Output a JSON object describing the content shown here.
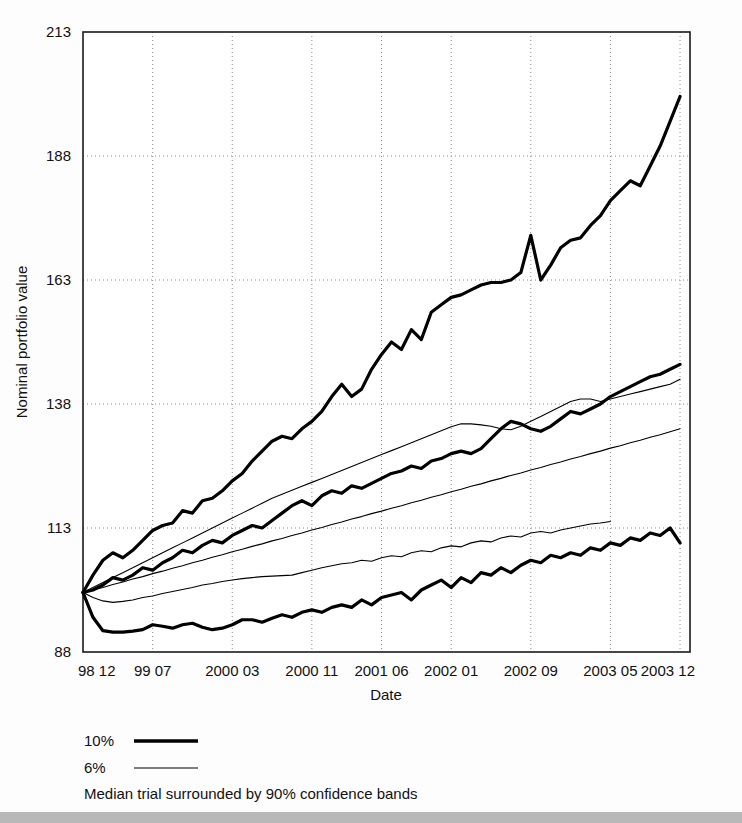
{
  "chart_data": {
    "type": "line",
    "title": "",
    "xlabel": "Date",
    "ylabel": "Nominal portfolio value",
    "grid": true,
    "legend_position": "below-axes-left",
    "caption": "Median trial surrounded by 90% confidence bands",
    "ylim": [
      88,
      213
    ],
    "yticks": [
      88,
      113,
      138,
      163,
      188,
      213
    ],
    "ytick_labels": [
      "88",
      "113",
      "138",
      "163",
      "188",
      "213"
    ],
    "xlim": [
      0,
      61
    ],
    "xticks": [
      0,
      7,
      15,
      23,
      30,
      37,
      45,
      53,
      60
    ],
    "xtick_labels": [
      "98 12",
      "99 07",
      "2000 03",
      "2000 11",
      "2001 06",
      "2002 01",
      "2002 09",
      "2003 05",
      "2003 12"
    ],
    "legend": [
      {
        "label": "10%",
        "style": "thick"
      },
      {
        "label": "6%",
        "style": "thin"
      }
    ],
    "series": [
      {
        "name": "10% upper 95th percentile band",
        "style": "thick",
        "linewidth": 3.2,
        "color": "#000000",
        "x": [
          0,
          1,
          2,
          3,
          4,
          5,
          6,
          7,
          8,
          9,
          10,
          11,
          12,
          13,
          14,
          15,
          16,
          17,
          18,
          19,
          20,
          21,
          22,
          23,
          24,
          25,
          26,
          27,
          28,
          29,
          30,
          31,
          32,
          33,
          34,
          35,
          36,
          37,
          38,
          39,
          40,
          41,
          42,
          43,
          44,
          45,
          46,
          47,
          48,
          49,
          50,
          51,
          52,
          53,
          54,
          55,
          56,
          57,
          58,
          59,
          60
        ],
        "values": [
          100,
          103.5,
          106.5,
          108.0,
          107.0,
          108.5,
          110.5,
          112.5,
          113.5,
          114.0,
          116.5,
          116.0,
          118.5,
          119.0,
          120.5,
          122.5,
          124.0,
          126.5,
          128.5,
          130.5,
          131.5,
          131.0,
          133.0,
          134.5,
          136.5,
          139.5,
          142.0,
          139.5,
          141.0,
          145.0,
          148.0,
          150.5,
          149.0,
          153.0,
          151.0,
          156.5,
          158.0,
          159.5,
          160.0,
          161.0,
          162.0,
          162.5,
          162.5,
          163.0,
          164.5,
          172.0,
          163.0,
          166.0,
          169.5,
          171.0,
          171.5,
          174.0,
          176.0,
          179.0,
          181.0,
          183.0,
          182.0,
          186.0,
          190.0,
          195.0,
          200.0
        ]
      },
      {
        "name": "10% median trial",
        "style": "thick",
        "linewidth": 3.2,
        "color": "#000000",
        "x": [
          0,
          1,
          2,
          3,
          4,
          5,
          6,
          7,
          8,
          9,
          10,
          11,
          12,
          13,
          14,
          15,
          16,
          17,
          18,
          19,
          20,
          21,
          22,
          23,
          24,
          25,
          26,
          27,
          28,
          29,
          30,
          31,
          32,
          33,
          34,
          35,
          36,
          37,
          38,
          39,
          40,
          41,
          42,
          43,
          44,
          45,
          46,
          47,
          48,
          49,
          50,
          51,
          52,
          53,
          54,
          55,
          56,
          57,
          58,
          59,
          60
        ],
        "values": [
          100,
          100.5,
          101.5,
          103.0,
          102.5,
          103.5,
          105.0,
          104.5,
          106.0,
          107.0,
          108.5,
          108.0,
          109.5,
          110.5,
          110.0,
          111.5,
          112.5,
          113.5,
          113.0,
          114.5,
          116.0,
          117.5,
          118.5,
          117.5,
          119.5,
          120.5,
          120.0,
          121.5,
          121.0,
          122.0,
          123.0,
          124.0,
          124.5,
          125.5,
          125.0,
          126.5,
          127.0,
          128.0,
          128.5,
          128.0,
          129.0,
          131.0,
          133.0,
          134.5,
          134.0,
          133.0,
          132.5,
          133.5,
          135.0,
          136.5,
          136.0,
          137.0,
          138.0,
          139.5,
          140.5,
          141.5,
          142.5,
          143.5,
          144.0,
          145.0,
          146.0
        ]
      },
      {
        "name": "10% lower 5th percentile band",
        "style": "thick",
        "linewidth": 3.2,
        "color": "#000000",
        "x": [
          0,
          1,
          2,
          3,
          4,
          5,
          6,
          7,
          8,
          9,
          10,
          11,
          12,
          13,
          14,
          15,
          16,
          17,
          18,
          19,
          20,
          21,
          22,
          23,
          24,
          25,
          26,
          27,
          28,
          29,
          30,
          31,
          32,
          33,
          34,
          35,
          36,
          37,
          38,
          39,
          40,
          41,
          42,
          43,
          44,
          45,
          46,
          47,
          48,
          49,
          50,
          51,
          52,
          53,
          54,
          55,
          56,
          57,
          58,
          59,
          60
        ],
        "values": [
          100,
          95.0,
          92.3,
          92.0,
          92.0,
          92.2,
          92.5,
          93.5,
          93.2,
          92.8,
          93.5,
          93.8,
          93.0,
          92.5,
          92.8,
          93.5,
          94.5,
          94.5,
          94.0,
          94.8,
          95.5,
          95.0,
          96.0,
          96.5,
          96.0,
          97.0,
          97.5,
          97.0,
          98.5,
          97.5,
          99.0,
          99.5,
          100.0,
          98.5,
          100.5,
          101.5,
          102.5,
          101.0,
          103.0,
          102.0,
          104.0,
          103.5,
          105.0,
          104.0,
          105.5,
          106.5,
          106.0,
          107.5,
          107.0,
          108.0,
          107.5,
          109.0,
          108.5,
          110.0,
          109.5,
          111.0,
          110.5,
          112.0,
          111.5,
          113.0,
          110.0
        ]
      },
      {
        "name": "6% upper 95th percentile band",
        "style": "thin",
        "linewidth": 1.1,
        "color": "#000000",
        "x": [
          0,
          1,
          2,
          3,
          4,
          5,
          6,
          7,
          8,
          9,
          10,
          11,
          12,
          13,
          14,
          15,
          16,
          17,
          18,
          19,
          20,
          21,
          22,
          23,
          24,
          25,
          26,
          27,
          28,
          29,
          30,
          31,
          32,
          33,
          34,
          35,
          36,
          37,
          38,
          39,
          40,
          41,
          42,
          43,
          44,
          45,
          46,
          47,
          48,
          49,
          50,
          51,
          52,
          53,
          54,
          55,
          56,
          57,
          58,
          59,
          60
        ],
        "values": [
          100,
          101.0,
          102.0,
          103.0,
          104.0,
          105.0,
          106.0,
          107.0,
          108.0,
          109.0,
          110.0,
          111.0,
          112.0,
          113.0,
          114.0,
          115.0,
          116.0,
          117.0,
          118.0,
          119.0,
          119.8,
          120.6,
          121.4,
          122.2,
          123.0,
          123.8,
          124.6,
          125.4,
          126.2,
          127.0,
          127.8,
          128.6,
          129.4,
          130.2,
          131.0,
          131.8,
          132.6,
          133.4,
          134.0,
          134.0,
          133.8,
          133.5,
          133.0,
          132.8,
          133.5,
          134.5,
          135.5,
          136.5,
          137.5,
          138.5,
          139.0,
          139.0,
          138.5,
          139.0,
          139.5,
          140.0,
          140.5,
          141.0,
          141.5,
          142.0,
          143.0
        ]
      },
      {
        "name": "6% median trial",
        "style": "thin",
        "linewidth": 1.1,
        "color": "#000000",
        "x": [
          0,
          1,
          2,
          3,
          4,
          5,
          6,
          7,
          8,
          9,
          10,
          11,
          12,
          13,
          14,
          15,
          16,
          17,
          18,
          19,
          20,
          21,
          22,
          23,
          24,
          25,
          26,
          27,
          28,
          29,
          30,
          31,
          32,
          33,
          34,
          35,
          36,
          37,
          38,
          39,
          40,
          41,
          42,
          43,
          44,
          45,
          46,
          47,
          48,
          49,
          50,
          51,
          52,
          53,
          54,
          55,
          56,
          57,
          58,
          59,
          60
        ],
        "values": [
          100,
          100.5,
          101.0,
          101.6,
          102.1,
          102.7,
          103.2,
          103.8,
          104.3,
          104.9,
          105.4,
          106.0,
          106.5,
          107.1,
          107.6,
          108.2,
          108.7,
          109.3,
          109.8,
          110.4,
          110.9,
          111.5,
          112.0,
          112.6,
          113.1,
          113.7,
          114.2,
          114.8,
          115.3,
          115.9,
          116.4,
          117.0,
          117.5,
          118.1,
          118.6,
          119.2,
          119.7,
          120.3,
          120.8,
          121.4,
          121.9,
          122.5,
          123.0,
          123.6,
          124.1,
          124.7,
          125.2,
          125.8,
          126.3,
          126.9,
          127.4,
          128.0,
          128.5,
          129.1,
          129.6,
          130.2,
          130.7,
          131.3,
          131.8,
          132.4,
          133.0
        ]
      },
      {
        "name": "6% lower 5th percentile band",
        "style": "thin",
        "linewidth": 1.1,
        "color": "#000000",
        "x": [
          0,
          1,
          2,
          3,
          4,
          5,
          6,
          7,
          8,
          9,
          10,
          11,
          12,
          13,
          14,
          15,
          16,
          17,
          18,
          19,
          20,
          21,
          22,
          23,
          24,
          25,
          26,
          27,
          28,
          29,
          30,
          31,
          32,
          33,
          34,
          35,
          36,
          37,
          38,
          39,
          40,
          41,
          42,
          43,
          44,
          45,
          46,
          47,
          48,
          49,
          50,
          51,
          52,
          53
        ],
        "values": [
          100,
          99.0,
          98.3,
          98.0,
          98.2,
          98.5,
          99.0,
          99.3,
          99.8,
          100.2,
          100.6,
          101.0,
          101.5,
          101.8,
          102.2,
          102.5,
          102.8,
          103.0,
          103.2,
          103.3,
          103.4,
          103.5,
          104.0,
          104.5,
          105.0,
          105.4,
          105.8,
          106.0,
          106.5,
          106.3,
          107.0,
          107.4,
          107.2,
          108.0,
          108.4,
          108.2,
          109.0,
          109.4,
          109.2,
          110.0,
          110.4,
          110.2,
          111.0,
          111.4,
          111.2,
          112.0,
          112.3,
          112.0,
          112.6,
          113.0,
          113.4,
          113.8,
          114.0,
          114.3
        ]
      }
    ]
  },
  "legend_panel": {
    "items": [
      {
        "label": "10%"
      },
      {
        "label": "6%"
      }
    ],
    "caption": "Median trial surrounded by 90% confidence bands"
  }
}
